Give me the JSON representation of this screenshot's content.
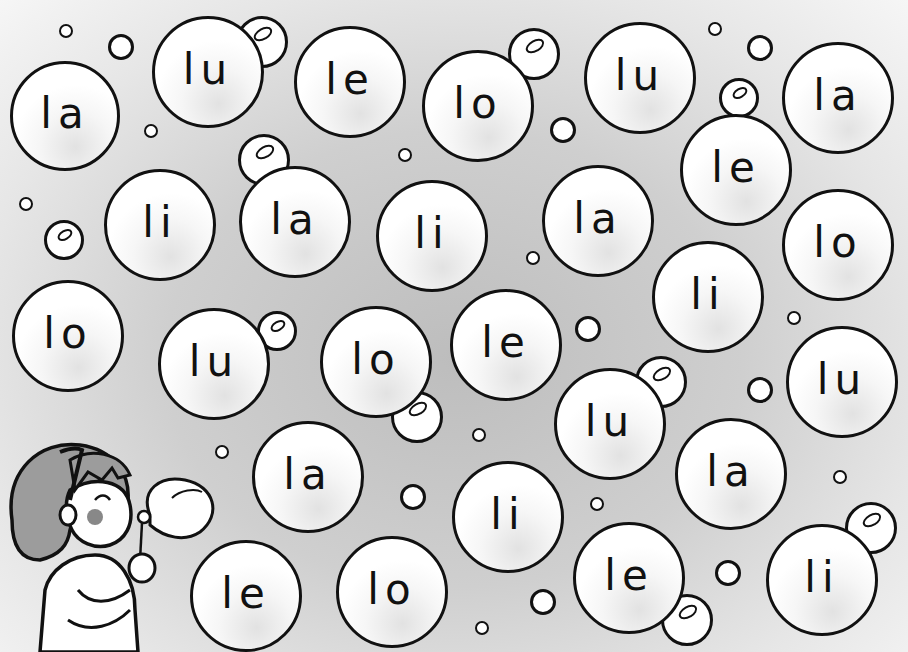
{
  "worksheet": {
    "description": "Syllable bubbles with letter l",
    "syllables_legend": [
      "la",
      "le",
      "li",
      "lo",
      "lu"
    ]
  },
  "bubbles": [
    {
      "text": "la",
      "x": 65,
      "y": 116,
      "r": 55
    },
    {
      "text": "lu",
      "x": 208,
      "y": 72,
      "r": 56
    },
    {
      "text": "le",
      "x": 350,
      "y": 82,
      "r": 56
    },
    {
      "text": "lo",
      "x": 478,
      "y": 106,
      "r": 56
    },
    {
      "text": "lu",
      "x": 640,
      "y": 78,
      "r": 56
    },
    {
      "text": "la",
      "x": 838,
      "y": 98,
      "r": 56
    },
    {
      "text": "le",
      "x": 736,
      "y": 170,
      "r": 56
    },
    {
      "text": "li",
      "x": 160,
      "y": 225,
      "r": 56
    },
    {
      "text": "la",
      "x": 295,
      "y": 222,
      "r": 56
    },
    {
      "text": "li",
      "x": 432,
      "y": 236,
      "r": 56
    },
    {
      "text": "la",
      "x": 598,
      "y": 221,
      "r": 56
    },
    {
      "text": "lo",
      "x": 838,
      "y": 245,
      "r": 56
    },
    {
      "text": "li",
      "x": 708,
      "y": 297,
      "r": 56
    },
    {
      "text": "lo",
      "x": 68,
      "y": 336,
      "r": 56
    },
    {
      "text": "lu",
      "x": 214,
      "y": 364,
      "r": 56
    },
    {
      "text": "lo",
      "x": 376,
      "y": 362,
      "r": 56
    },
    {
      "text": "le",
      "x": 506,
      "y": 345,
      "r": 56
    },
    {
      "text": "lu",
      "x": 610,
      "y": 424,
      "r": 56
    },
    {
      "text": "lu",
      "x": 842,
      "y": 382,
      "r": 56
    },
    {
      "text": "la",
      "x": 308,
      "y": 477,
      "r": 56
    },
    {
      "text": "la",
      "x": 731,
      "y": 474,
      "r": 56
    },
    {
      "text": "li",
      "x": 508,
      "y": 517,
      "r": 56
    },
    {
      "text": "le",
      "x": 246,
      "y": 596,
      "r": 56
    },
    {
      "text": "lo",
      "x": 392,
      "y": 592,
      "r": 56
    },
    {
      "text": "le",
      "x": 629,
      "y": 578,
      "r": 56
    },
    {
      "text": "li",
      "x": 822,
      "y": 580,
      "r": 56
    }
  ],
  "small_bubbles": [
    {
      "x": 66,
      "y": 31,
      "r": 7,
      "shine": false
    },
    {
      "x": 121,
      "y": 47,
      "r": 13,
      "shine": false
    },
    {
      "x": 262,
      "y": 42,
      "r": 26,
      "shine": true
    },
    {
      "x": 151,
      "y": 131,
      "r": 7,
      "shine": false
    },
    {
      "x": 264,
      "y": 160,
      "r": 26,
      "shine": true
    },
    {
      "x": 26,
      "y": 204,
      "r": 7,
      "shine": false
    },
    {
      "x": 64,
      "y": 240,
      "r": 20,
      "shine": true
    },
    {
      "x": 405,
      "y": 155,
      "r": 7,
      "shine": false
    },
    {
      "x": 534,
      "y": 54,
      "r": 26,
      "shine": true
    },
    {
      "x": 715,
      "y": 29,
      "r": 7,
      "shine": false
    },
    {
      "x": 760,
      "y": 48,
      "r": 13,
      "shine": false
    },
    {
      "x": 563,
      "y": 130,
      "r": 13,
      "shine": false
    },
    {
      "x": 739,
      "y": 98,
      "r": 20,
      "shine": true
    },
    {
      "x": 533,
      "y": 258,
      "r": 7,
      "shine": false
    },
    {
      "x": 794,
      "y": 318,
      "r": 7,
      "shine": false
    },
    {
      "x": 277,
      "y": 331,
      "r": 20,
      "shine": true
    },
    {
      "x": 588,
      "y": 329,
      "r": 13,
      "shine": false
    },
    {
      "x": 417,
      "y": 417,
      "r": 26,
      "shine": true
    },
    {
      "x": 661,
      "y": 382,
      "r": 26,
      "shine": true
    },
    {
      "x": 760,
      "y": 390,
      "r": 13,
      "shine": false
    },
    {
      "x": 222,
      "y": 452,
      "r": 7,
      "shine": false
    },
    {
      "x": 479,
      "y": 435,
      "r": 7,
      "shine": false
    },
    {
      "x": 413,
      "y": 497,
      "r": 13,
      "shine": false
    },
    {
      "x": 597,
      "y": 504,
      "r": 7,
      "shine": false
    },
    {
      "x": 840,
      "y": 477,
      "r": 7,
      "shine": false
    },
    {
      "x": 871,
      "y": 528,
      "r": 26,
      "shine": true
    },
    {
      "x": 543,
      "y": 602,
      "r": 13,
      "shine": false
    },
    {
      "x": 728,
      "y": 573,
      "r": 13,
      "shine": false
    },
    {
      "x": 482,
      "y": 628,
      "r": 7,
      "shine": false
    },
    {
      "x": 687,
      "y": 620,
      "r": 26,
      "shine": true
    }
  ]
}
